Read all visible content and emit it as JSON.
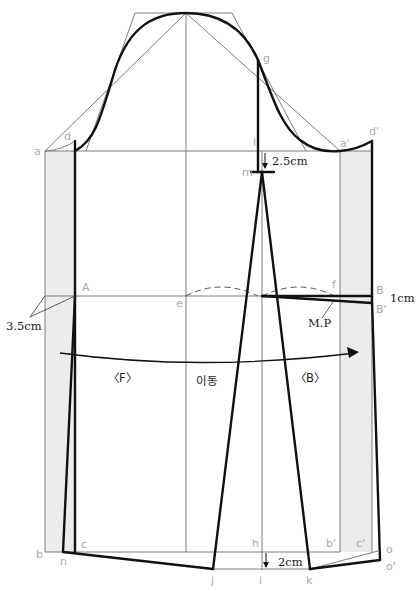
{
  "diagram": {
    "type": "garment-pattern-draft",
    "colors": {
      "background": "#ffffff",
      "guide_line": "#6f6f6f",
      "pattern_line": "#111111",
      "seam_allowance_fill": "#ececec",
      "point_label": "#a9a9a9",
      "measurement_label": "#1a1a1a"
    },
    "point_labels": {
      "a": "a",
      "d": "d",
      "g": "g",
      "l": "l",
      "m": "m",
      "a_prime": "a'",
      "d_prime": "d'",
      "A": "A",
      "e": "e",
      "f": "f",
      "B": "B",
      "B_prime": "B'",
      "b": "b",
      "n": "n",
      "c": "c",
      "h": "h",
      "b_prime": "b'",
      "c_prime": "c'",
      "o": "o",
      "o_prime": "o'",
      "j": "j",
      "i": "i",
      "k": "k"
    },
    "measurements": {
      "shoulder_drop": "2.5cm",
      "side_width": "3.5cm",
      "back_drop": "1cm",
      "hem_drop": "2cm"
    },
    "annotations": {
      "front": "〈F〉",
      "back": "〈B〉",
      "move": "이동",
      "match_point": "M.P"
    }
  }
}
